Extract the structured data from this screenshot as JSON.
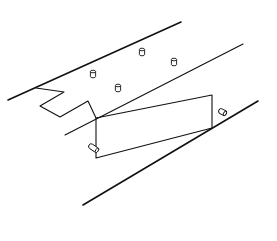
{
  "figure": {
    "title": "",
    "stroke_color": "#111111",
    "background": "#ffffff"
  },
  "lines": {
    "top_edge": {
      "x1": 8,
      "y1": 100,
      "x2": 181,
      "y2": 22
    },
    "middle_edge": {
      "x1": 65,
      "y1": 135,
      "x2": 243,
      "y2": 44
    },
    "bottom_edge": {
      "x1": 83,
      "y1": 205,
      "x2": 258,
      "y2": 101
    }
  },
  "zigzag_cutout": {
    "points": "36,88 64,92 40,106 60,117 88,101 96,118"
  },
  "panel": {
    "points": "96,118 212,95 212,128 96,158 96,118"
  },
  "vertical_pegs": [
    {
      "cx": 93,
      "cy": 74
    },
    {
      "cx": 142,
      "cy": 52
    },
    {
      "cx": 118,
      "cy": 88
    },
    {
      "cx": 174,
      "cy": 62
    }
  ],
  "horizontal_pegs": [
    {
      "x1": 89,
      "y1": 145,
      "x2": 98,
      "y2": 151
    },
    {
      "x1": 219,
      "y1": 110,
      "x2": 226,
      "y2": 114
    }
  ]
}
